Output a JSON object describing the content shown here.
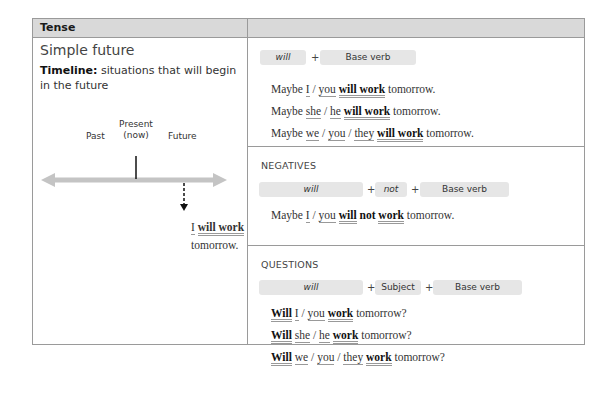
{
  "table": {
    "header": {
      "col1": "Tense",
      "col2": ""
    },
    "tense": {
      "title": "Simple future",
      "timeline_label": "Timeline:",
      "timeline_desc": "situations that will begin in the future",
      "timeline": {
        "past": "Past",
        "present_line1": "Present",
        "present_line2": "(now)",
        "future": "Future",
        "example_subject": "I",
        "example_verb": "will work",
        "example_end": "tomorrow."
      }
    },
    "affirmative": {
      "formula": [
        "will",
        "+",
        "Base verb"
      ],
      "examples": [
        {
          "pre": "Maybe",
          "subjects": [
            "I",
            "you"
          ],
          "verb": "will work",
          "end": "tomorrow."
        },
        {
          "pre": "Maybe",
          "subjects": [
            "she",
            "he"
          ],
          "verb": "will work",
          "end": "tomorrow."
        },
        {
          "pre": "Maybe",
          "subjects": [
            "we",
            "you",
            "they"
          ],
          "verb": "will work",
          "end": "tomorrow."
        }
      ]
    },
    "negatives": {
      "heading": "NEGATIVES",
      "formula": [
        "will",
        "+",
        "not",
        "+",
        "Base verb"
      ],
      "example": {
        "pre": "Maybe",
        "subjects": [
          "I",
          "you"
        ],
        "will": "will",
        "not": "not",
        "verb": "work",
        "end": "tomorrow."
      }
    },
    "questions": {
      "heading": "QUESTIONS",
      "formula": [
        "will",
        "+",
        "Subject",
        "+",
        "Base verb"
      ],
      "examples": [
        {
          "aux": "Will",
          "subjects": [
            "I",
            "you"
          ],
          "verb": "work",
          "end": "tomorrow?"
        },
        {
          "aux": "Will",
          "subjects": [
            "she",
            "he"
          ],
          "verb": "work",
          "end": "tomorrow?"
        },
        {
          "aux": "Will",
          "subjects": [
            "we",
            "you",
            "they"
          ],
          "verb": "work",
          "end": "tomorrow?"
        }
      ]
    },
    "colors": {
      "header_bg": "#d9d9d9",
      "border": "#9a9a9a",
      "pill_bg": "#e6e6e6",
      "arrow": "#c4c4c4"
    }
  }
}
